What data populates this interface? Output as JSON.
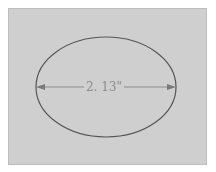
{
  "diagram": {
    "shape": "ellipse",
    "dimension_label": "2. 13\"",
    "colors": {
      "background": "#cfcfcf",
      "ellipse_stroke": "#555555",
      "dimension_line": "#8e8e8e",
      "label": "#8e8e8e"
    }
  }
}
